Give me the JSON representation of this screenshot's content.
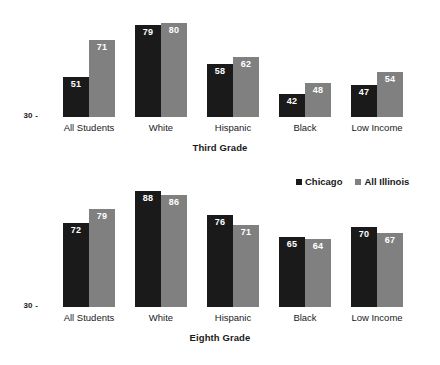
{
  "legend": {
    "position": "top-right-of-lower-panel",
    "entries": [
      {
        "label": "Chicago",
        "color": "#1a1a1a",
        "key": "chicago"
      },
      {
        "label": "All Illinois",
        "color": "#808080",
        "key": "illinois"
      }
    ]
  },
  "axis": {
    "tick_label": "30 -",
    "baseline_value": 30
  },
  "chart_data": [
    {
      "type": "bar",
      "title": "Third Grade",
      "xlabel": "",
      "ylabel": "",
      "ylim": [
        30,
        92
      ],
      "grid": false,
      "legend_position": "lower-panel-top-right",
      "categories": [
        "All Students",
        "White",
        "Hispanic",
        "Black",
        "Low Income"
      ],
      "series": [
        {
          "name": "Chicago",
          "color": "#1a1a1a",
          "values": [
            51,
            79,
            58,
            42,
            47
          ]
        },
        {
          "name": "All Illinois",
          "color": "#808080",
          "values": [
            71,
            80,
            62,
            48,
            54
          ]
        }
      ],
      "tick_labels": [
        "30 -"
      ]
    },
    {
      "type": "bar",
      "title": "Eighth Grade",
      "xlabel": "",
      "ylabel": "",
      "ylim": [
        30,
        92
      ],
      "grid": false,
      "legend_position": "lower-panel-top-right",
      "categories": [
        "All Students",
        "White",
        "Hispanic",
        "Black",
        "Low Income"
      ],
      "series": [
        {
          "name": "Chicago",
          "color": "#1a1a1a",
          "values": [
            72,
            88,
            76,
            65,
            70
          ]
        },
        {
          "name": "All Illinois",
          "color": "#808080",
          "values": [
            79,
            86,
            71,
            64,
            67
          ]
        }
      ],
      "tick_labels": [
        "30 -"
      ]
    }
  ]
}
